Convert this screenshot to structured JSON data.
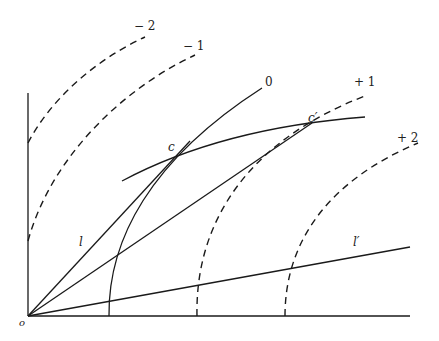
{
  "diagram": {
    "type": "geometric-construction",
    "axes": {
      "origin_label": "o"
    },
    "dashed_curves": [
      {
        "label": "− 2"
      },
      {
        "label": "− 1"
      },
      {
        "label": "+ 1"
      },
      {
        "label": "+ 2"
      }
    ],
    "solid_curves": [
      {
        "label": "0"
      }
    ],
    "lines": [
      {
        "label": "l"
      },
      {
        "label": "l′"
      }
    ],
    "points": [
      {
        "label": "c"
      },
      {
        "label": "c′"
      }
    ]
  }
}
